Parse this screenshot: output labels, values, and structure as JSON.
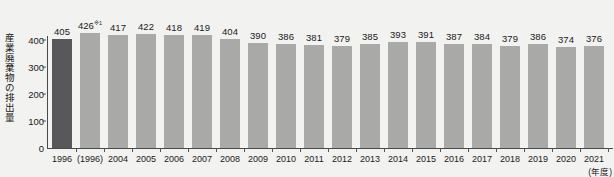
{
  "chart_data": {
    "type": "bar",
    "title": "",
    "subtitle": "",
    "xlabel": "(年度)",
    "ylabel": "産業廃棄物の排出量",
    "ylim": [
      0,
      450
    ],
    "yticks": [
      0,
      100,
      200,
      300,
      400
    ],
    "ytick_labels": [
      "0",
      "100",
      "200",
      "300",
      "400"
    ],
    "grid": false,
    "legend": "none",
    "categories": [
      "1996",
      "(1996)",
      "2004",
      "2005",
      "2006",
      "2007",
      "2008",
      "2009",
      "2010",
      "2011",
      "2012",
      "2013",
      "2014",
      "2015",
      "2016",
      "2017",
      "2018",
      "2019",
      "2020",
      "2021"
    ],
    "values": [
      405,
      426,
      417,
      422,
      418,
      419,
      404,
      390,
      386,
      381,
      379,
      385,
      393,
      391,
      387,
      384,
      379,
      386,
      374,
      376
    ],
    "value_labels": [
      "405",
      "426",
      "417",
      "422",
      "418",
      "419",
      "404",
      "390",
      "386",
      "381",
      "379",
      "385",
      "393",
      "391",
      "387",
      "384",
      "379",
      "386",
      "374",
      "376"
    ],
    "annotations": [
      {
        "index": 1,
        "marker": "※1",
        "note": "426※1"
      }
    ],
    "series": [
      {
        "name": "産業廃棄物の排出量",
        "values": [
          405,
          426,
          417,
          422,
          418,
          419,
          404,
          390,
          386,
          381,
          379,
          385,
          393,
          391,
          387,
          384,
          379,
          386,
          374,
          376
        ]
      }
    ],
    "colors": {
      "bar_default": "#a9a9a7",
      "bar_highlight": "#58585a",
      "axis": "#4a4a4a",
      "text": "#1a1a1a",
      "background": "#f2f2f0"
    },
    "highlight_index": 0
  }
}
